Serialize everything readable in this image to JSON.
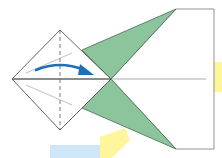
{
  "diagram": {
    "type": "origami-fold-step",
    "colors": {
      "paper_front": "#ffffff",
      "paper_back": "#8cc49c",
      "outline": "#555555",
      "fold_line": "#888888",
      "arrow": "#1f6fb5",
      "highlight_yellow": "#fff59a",
      "highlight_blue": "#cfe6f7"
    },
    "arrow_direction": "right",
    "fold_line_style": "dashed-vertical"
  }
}
